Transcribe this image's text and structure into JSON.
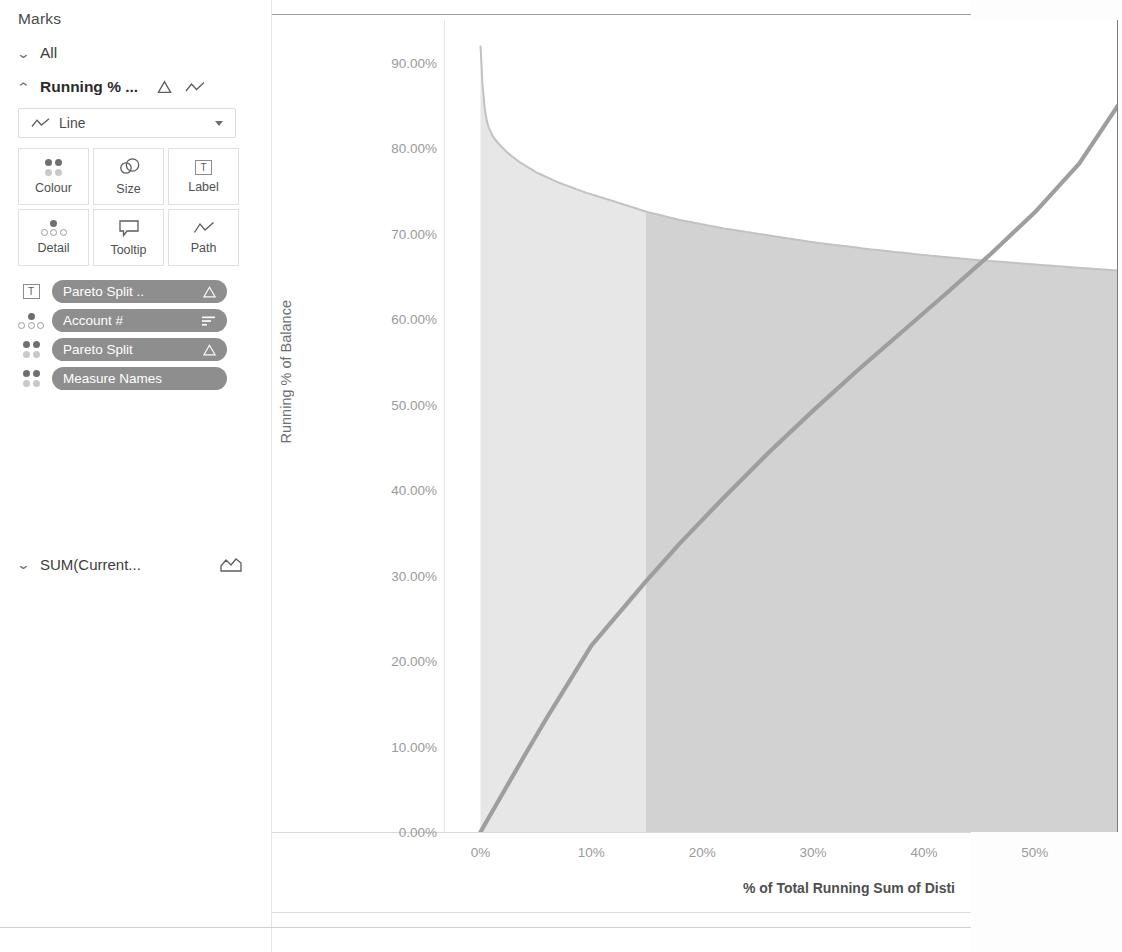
{
  "sidebar": {
    "title": "Marks",
    "cards": [
      {
        "label": "All",
        "expanded": false,
        "chevron": "chevron-down"
      },
      {
        "label": "Running % ...",
        "expanded": true,
        "chevron": "chevron-up",
        "icons": [
          "delta-icon",
          "line-icon"
        ]
      }
    ],
    "mark_type": {
      "label": "Line",
      "icon": "line-icon",
      "caret": "chevron-down-icon"
    },
    "shelf_buttons": [
      {
        "label": "Colour",
        "icon": "colour-dots-icon"
      },
      {
        "label": "Size",
        "icon": "size-circles-icon"
      },
      {
        "label": "Label",
        "icon": "label-text-icon"
      },
      {
        "label": "Detail",
        "icon": "detail-dots-icon"
      },
      {
        "label": "Tooltip",
        "icon": "tooltip-bubble-icon"
      },
      {
        "label": "Path",
        "icon": "path-line-icon"
      }
    ],
    "pills": [
      {
        "glyph": "label-text-icon",
        "text": "Pareto Split ..",
        "badge": "delta-icon"
      },
      {
        "glyph": "detail-dots-icon",
        "text": "Account #",
        "badge": "sort-icon"
      },
      {
        "glyph": "colour-dots-icon",
        "text": "Pareto Split",
        "badge": "delta-icon"
      },
      {
        "glyph": "colour-dots-icon",
        "text": "Measure Names",
        "badge": ""
      }
    ],
    "sum_card": {
      "label": "SUM(Current...",
      "chevron": "chevron-down",
      "icon": "area-chart-icon"
    }
  },
  "chart_data": {
    "type": "area",
    "title": "",
    "xlabel": "% of Total Running Sum of Disti",
    "ylabel": "Running % of Balance",
    "xlim": [
      -3.2,
      57.5
    ],
    "ylim": [
      0,
      95
    ],
    "grid": false,
    "legend": false,
    "xticks": [
      "0%",
      "10%",
      "20%",
      "30%",
      "40%",
      "50%"
    ],
    "xtick_values": [
      0,
      10,
      20,
      30,
      40,
      50
    ],
    "yticks": [
      "0.00%",
      "10.00%",
      "20.00%",
      "30.00%",
      "40.00%",
      "50.00%",
      "60.00%",
      "70.00%",
      "80.00%",
      "90.00%"
    ],
    "ytick_values": [
      0,
      10,
      20,
      30,
      40,
      50,
      60,
      70,
      80,
      90
    ],
    "bands": [
      {
        "name": "pareto-split-low",
        "x_start": 0,
        "x_end": 14.9,
        "colour": "#e7e7e7"
      },
      {
        "name": "pareto-split-high",
        "x_start": 14.9,
        "x_end": 57.5,
        "colour": "#d2d2d2"
      }
    ],
    "series": [
      {
        "name": "Running % of Balance (descending area)",
        "type": "area",
        "colour": "#d9d9d9",
        "x": [
          0.0,
          0.15,
          0.3,
          0.5,
          0.8,
          1.2,
          1.8,
          2.5,
          3.5,
          5.0,
          7.0,
          9.5,
          12.0,
          14.9,
          18.0,
          22.0,
          26.0,
          30.0,
          35.0,
          40.0,
          45.0,
          50.0,
          54.0,
          57.5
        ],
        "y": [
          92.0,
          88.0,
          85.5,
          83.5,
          82.2,
          81.2,
          80.3,
          79.4,
          78.4,
          77.2,
          76.0,
          74.8,
          73.8,
          72.6,
          71.6,
          70.6,
          69.8,
          69.0,
          68.2,
          67.5,
          66.9,
          66.4,
          66.0,
          65.7
        ]
      },
      {
        "name": "Cumulative Pareto line",
        "type": "line",
        "colour": "#9e9e9e",
        "x": [
          0.0,
          2.0,
          4.0,
          6.0,
          8.0,
          10.0,
          14.9,
          18.0,
          22.0,
          26.0,
          30.0,
          34.0,
          38.0,
          42.0,
          46.0,
          50.0,
          54.0,
          57.5
        ],
        "y": [
          0.0,
          4.5,
          9.0,
          13.4,
          17.6,
          21.8,
          29.3,
          33.8,
          39.2,
          44.4,
          49.3,
          54.0,
          58.5,
          63.0,
          67.6,
          72.5,
          78.2,
          85.0
        ]
      }
    ]
  }
}
